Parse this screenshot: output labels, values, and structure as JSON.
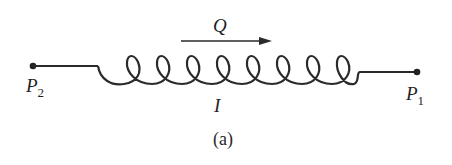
{
  "diagram": {
    "labels": {
      "flow": "Q",
      "current": "I",
      "terminal_left": "P",
      "terminal_left_sub": "2",
      "terminal_right": "P",
      "terminal_right_sub": "1",
      "caption": "(a)"
    },
    "coil_loops": 8,
    "colors": {
      "stroke": "#2a2a2a",
      "background": "#ffffff"
    }
  }
}
